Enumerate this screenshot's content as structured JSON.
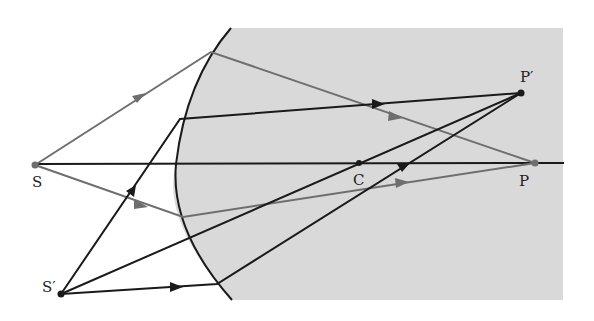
{
  "diagram": {
    "type": "refraction at spherical surface",
    "colors": {
      "background": "#ffffff",
      "medium": "#d9d9d9",
      "black_ray": "#1a1a1a",
      "gray_ray": "#6e6e6e",
      "axis": "#1a1a1a"
    },
    "points": {
      "S": {
        "label": "S",
        "x": 35,
        "y": 165
      },
      "S_prime": {
        "label": "S′",
        "x": 61,
        "y": 294
      },
      "C": {
        "label": "C",
        "x": 359,
        "y": 163
      },
      "P": {
        "label": "P",
        "x": 535,
        "y": 163
      },
      "P_prime": {
        "label": "P′",
        "x": 521,
        "y": 93
      }
    },
    "labels": {
      "S": "S",
      "S_prime": "S′",
      "C": "C",
      "P": "P",
      "P_prime": "P′"
    }
  }
}
